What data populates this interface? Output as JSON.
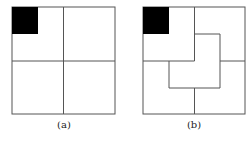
{
  "panels": [
    {
      "id": "a",
      "caption": "(a)",
      "description": "Square divided into 2x2 quadrants, top-left corner cell shaded black"
    },
    {
      "id": "b",
      "caption": "(b)",
      "description": "Square tiled by L-shaped trominoes around the shaded corner cell"
    }
  ],
  "colors": {
    "line": "#555555",
    "fill": "#000000",
    "background": "#ffffff"
  }
}
